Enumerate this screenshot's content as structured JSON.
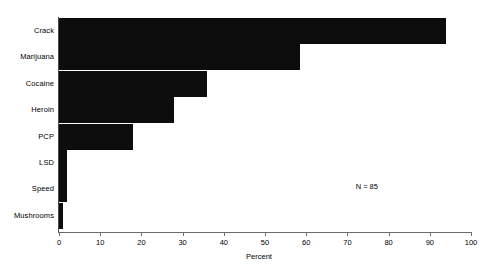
{
  "chart_data": {
    "type": "bar",
    "orientation": "horizontal",
    "title": "",
    "subtitle": "",
    "categories": [
      "Crack",
      "Marijuana",
      "Cocaine",
      "Heroin",
      "PCP",
      "LSD",
      "Speed",
      "Mushrooms"
    ],
    "values": [
      94,
      58.5,
      36,
      28,
      18,
      2,
      2,
      1
    ],
    "xlabel": "Percent",
    "ylabel": "",
    "xlim": [
      0,
      100
    ],
    "xticks": [
      0,
      10,
      20,
      30,
      40,
      50,
      60,
      70,
      80,
      90,
      100
    ],
    "xtick_labels": [
      "0",
      "10",
      "20",
      "30",
      "40",
      "50",
      "60",
      "70",
      "80",
      "90",
      "100"
    ],
    "grid": false,
    "legend": null,
    "bar_color": "#0d0d0d",
    "background_color": "#ffffff",
    "axis_color": "#6b6b6b",
    "annotations": [
      {
        "text": "N = 85",
        "x": 72,
        "y_category": "Speed"
      }
    ]
  }
}
